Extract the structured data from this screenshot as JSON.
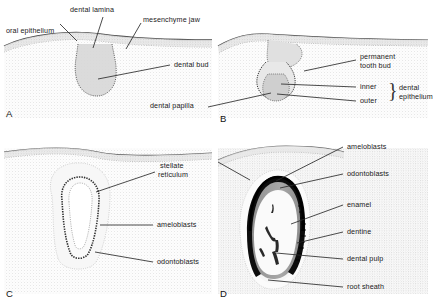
{
  "figure": {
    "background_color": "#ffffff",
    "text_color": "#1a1a1a"
  },
  "panels": [
    {
      "id": "A",
      "letter": "A",
      "stage": "bud stage",
      "labels": [
        {
          "name": "oral-epithelium",
          "text": "oral epithelium"
        },
        {
          "name": "dental-lamina",
          "text": "dental lamina"
        },
        {
          "name": "mesenchyme-jaw",
          "text": "mesenchyme jaw"
        },
        {
          "name": "dental-bud",
          "text": "dental bud"
        }
      ]
    },
    {
      "id": "B",
      "letter": "B",
      "stage": "cap stage",
      "labels": [
        {
          "name": "permanent-tooth-bud-line1",
          "text": "permanent"
        },
        {
          "name": "permanent-tooth-bud-line2",
          "text": "tooth bud"
        },
        {
          "name": "inner",
          "text": "inner"
        },
        {
          "name": "outer",
          "text": "outer"
        },
        {
          "name": "dental-epithelium-line1",
          "text": "dental"
        },
        {
          "name": "dental-epithelium-line2",
          "text": "epithelium"
        },
        {
          "name": "dental-papilla",
          "text": "dental papilla"
        }
      ],
      "bracket": "}"
    },
    {
      "id": "C",
      "letter": "C",
      "stage": "bell stage",
      "labels": [
        {
          "name": "stellate-reticulum-line1",
          "text": "stellate"
        },
        {
          "name": "stellate-reticulum-line2",
          "text": "reticulum"
        },
        {
          "name": "ameloblasts",
          "text": "ameloblasts"
        },
        {
          "name": "odontoblasts",
          "text": "odontoblasts"
        }
      ]
    },
    {
      "id": "D",
      "letter": "D",
      "stage": "apposition / maturation stage",
      "labels": [
        {
          "name": "ameloblasts",
          "text": "ameloblasts"
        },
        {
          "name": "odontoblasts",
          "text": "odontoblasts"
        },
        {
          "name": "enamel",
          "text": "enamel"
        },
        {
          "name": "dentine",
          "text": "dentine"
        },
        {
          "name": "dental-pulp",
          "text": "dental pulp"
        },
        {
          "name": "root-sheath",
          "text": "root sheath"
        }
      ]
    }
  ],
  "colors": {
    "enamel": "#0d0d0d",
    "dentine": "#9a9a9a",
    "pulp": "#f4f4f4",
    "mesenchyme": "#f3f3f3",
    "epithelium": "#dedede",
    "leader_line": "#2b2b2b"
  }
}
